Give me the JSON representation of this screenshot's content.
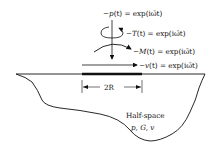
{
  "diagram": {
    "loads": [
      {
        "id": "vertical",
        "prefix": "−",
        "symbol": "p",
        "arg": "(t)",
        "rhs": " = exp(iω̄t)"
      },
      {
        "id": "torsion",
        "prefix": "−",
        "symbol": "T",
        "arg": "(t)",
        "rhs": " = exp(iω̄t)"
      },
      {
        "id": "moment",
        "prefix": "−",
        "symbol": "M",
        "arg": "(t)",
        "rhs": " = exp(iω̄t)"
      },
      {
        "id": "horizontal",
        "prefix": "−",
        "symbol": "v",
        "arg": "(t)",
        "rhs": " = exp(iω̄t)"
      }
    ],
    "dimension_label": "2R",
    "halfspace_label": "Half-space",
    "halfspace_params": "p, G, v"
  }
}
